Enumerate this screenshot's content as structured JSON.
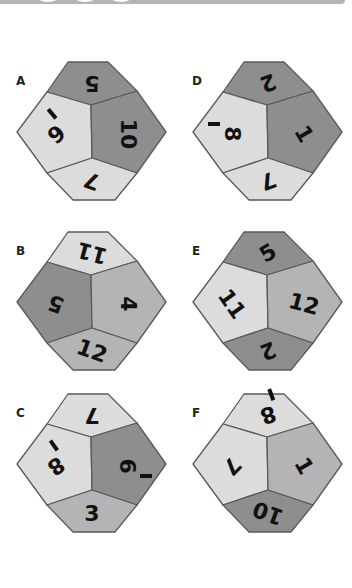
{
  "colors": {
    "light": "#dcdcdc",
    "mid": "#b4b4b4",
    "dark": "#8e8e8e",
    "outline": "#5a5a5a"
  },
  "dice": [
    {
      "label": "A",
      "faces": {
        "top": {
          "number": "5",
          "shade": "#8e8e8e",
          "rotation": 180
        },
        "left": {
          "number": "6",
          "shade": "#dcdcdc",
          "rotation": 140,
          "underline": true
        },
        "right": {
          "number": "10",
          "shade": "#8e8e8e",
          "rotation": 90
        },
        "bottom": {
          "number": "7",
          "shade": "#dcdcdc",
          "rotation": 200
        }
      }
    },
    {
      "label": "B",
      "faces": {
        "top": {
          "number": "11",
          "shade": "#dcdcdc",
          "rotation": 195
        },
        "left": {
          "number": "5",
          "shade": "#8e8e8e",
          "rotation": 200
        },
        "right": {
          "number": "4",
          "shade": "#b4b4b4",
          "rotation": 90
        },
        "bottom": {
          "number": "12",
          "shade": "#b4b4b4",
          "rotation": 20
        }
      }
    },
    {
      "label": "C",
      "faces": {
        "top": {
          "number": "7",
          "shade": "#dcdcdc",
          "rotation": 180
        },
        "left": {
          "number": "8",
          "shade": "#dcdcdc",
          "rotation": 145,
          "underline": true
        },
        "right": {
          "number": "9",
          "shade": "#8e8e8e",
          "rotation": 270,
          "underline": true
        },
        "bottom": {
          "number": "3",
          "shade": "#b4b4b4",
          "rotation": 0
        }
      }
    },
    {
      "label": "D",
      "faces": {
        "top": {
          "number": "2",
          "shade": "#8e8e8e",
          "rotation": 160
        },
        "left": {
          "number": "8",
          "shade": "#dcdcdc",
          "rotation": 90,
          "underline": true
        },
        "right": {
          "number": "1",
          "shade": "#8e8e8e",
          "rotation": 60
        },
        "bottom": {
          "number": "7",
          "shade": "#dcdcdc",
          "rotation": 160
        }
      }
    },
    {
      "label": "E",
      "faces": {
        "top": {
          "number": "5",
          "shade": "#8e8e8e",
          "rotation": 330
        },
        "left": {
          "number": "11",
          "shade": "#dcdcdc",
          "rotation": 55
        },
        "right": {
          "number": "12",
          "shade": "#b4b4b4",
          "rotation": 15
        },
        "bottom": {
          "number": "2",
          "shade": "#8e8e8e",
          "rotation": 160
        }
      }
    },
    {
      "label": "F",
      "faces": {
        "top": {
          "number": "8",
          "shade": "#dcdcdc",
          "rotation": 160,
          "underline": true
        },
        "left": {
          "number": "7",
          "shade": "#dcdcdc",
          "rotation": 135
        },
        "right": {
          "number": "1",
          "shade": "#b4b4b4",
          "rotation": 60
        },
        "bottom": {
          "number": "10",
          "shade": "#8e8e8e",
          "rotation": 200
        }
      }
    }
  ]
}
